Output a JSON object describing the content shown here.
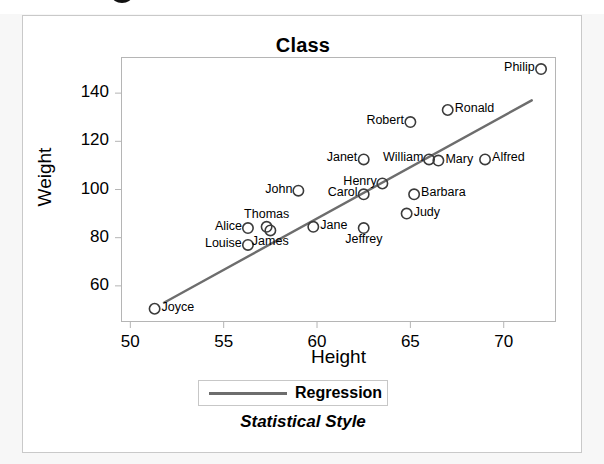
{
  "chart_data": {
    "type": "scatter",
    "title": "Class",
    "xlabel": "Height",
    "ylabel": "Weight",
    "xlim": [
      49.5,
      72.8
    ],
    "ylim": [
      45,
      155
    ],
    "xticks": [
      50,
      55,
      60,
      65,
      70
    ],
    "yticks": [
      60,
      80,
      100,
      120,
      140
    ],
    "grid": false,
    "legend_position": "bottom",
    "footnote": "Statistical Style",
    "legend": [
      {
        "label": "Regression",
        "marker": "line",
        "color": "#6d6d6d"
      }
    ],
    "point_label_field": "name",
    "x": [
      51.3,
      56.3,
      56.3,
      57.3,
      57.5,
      59.0,
      59.8,
      62.5,
      62.5,
      62.5,
      63.5,
      64.8,
      65.0,
      65.2,
      66.0,
      66.5,
      67.0,
      69.0,
      72.0
    ],
    "y": [
      50.5,
      84.0,
      77.0,
      84.5,
      83.0,
      99.5,
      84.5,
      112.5,
      98.0,
      84.0,
      102.5,
      90.0,
      128.0,
      98.0,
      112.5,
      112.0,
      133.0,
      112.5,
      150.0
    ],
    "points": [
      {
        "name": "Joyce",
        "x": 51.3,
        "y": 50.5,
        "label_side": "right"
      },
      {
        "name": "Alice",
        "x": 56.3,
        "y": 84.0,
        "label_side": "left"
      },
      {
        "name": "Louise",
        "x": 56.3,
        "y": 77.0,
        "label_side": "left"
      },
      {
        "name": "Thomas",
        "x": 57.3,
        "y": 84.5,
        "label_side": "above"
      },
      {
        "name": "James",
        "x": 57.5,
        "y": 83.0,
        "label_side": "below"
      },
      {
        "name": "John",
        "x": 59.0,
        "y": 99.5,
        "label_side": "left"
      },
      {
        "name": "Jane",
        "x": 59.8,
        "y": 84.5,
        "label_side": "right"
      },
      {
        "name": "Janet",
        "x": 62.5,
        "y": 112.5,
        "label_side": "left"
      },
      {
        "name": "Carol",
        "x": 62.5,
        "y": 98.0,
        "label_side": "left"
      },
      {
        "name": "Jeffrey",
        "x": 62.5,
        "y": 84.0,
        "label_side": "below"
      },
      {
        "name": "Henry",
        "x": 63.5,
        "y": 102.5,
        "label_side": "left"
      },
      {
        "name": "Judy",
        "x": 64.8,
        "y": 90.0,
        "label_side": "right"
      },
      {
        "name": "Robert",
        "x": 65.0,
        "y": 128.0,
        "label_side": "left"
      },
      {
        "name": "Barbara",
        "x": 65.2,
        "y": 98.0,
        "label_side": "right"
      },
      {
        "name": "William",
        "x": 66.0,
        "y": 112.5,
        "label_side": "left"
      },
      {
        "name": "Mary",
        "x": 66.5,
        "y": 112.0,
        "label_side": "right"
      },
      {
        "name": "Ronald",
        "x": 67.0,
        "y": 133.0,
        "label_side": "right"
      },
      {
        "name": "Alfred",
        "x": 69.0,
        "y": 112.5,
        "label_side": "right"
      },
      {
        "name": "Philip",
        "x": 72.0,
        "y": 150.0,
        "label_side": "left"
      }
    ],
    "regression": {
      "label": "Regression",
      "x_start": 51.8,
      "y_start": 53.0,
      "x_end": 71.5,
      "y_end": 137.0,
      "color": "#6d6d6d"
    }
  }
}
